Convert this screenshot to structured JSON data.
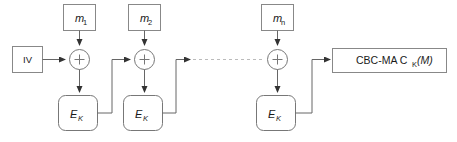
{
  "diagram": {
    "background_color": "#ffffff",
    "line_color": "#666666",
    "box_stroke_color": "#888888",
    "dashed_color": "#bbbbbb",
    "text_color": "#1a1a1a"
  },
  "iv": {
    "label": "IV"
  },
  "messages": [
    {
      "base": "m",
      "subscript": "1",
      "name": "message-block-1"
    },
    {
      "base": "m",
      "subscript": "2",
      "name": "message-block-2"
    },
    {
      "base": "m",
      "subscript": "n",
      "name": "message-block-n"
    }
  ],
  "xor": {
    "glyph": "+",
    "count": 3
  },
  "cipher": {
    "base": "E",
    "subscript": "K",
    "count": 3
  },
  "output": {
    "prefix": "CBC-MA C",
    "subscript": "K",
    "suffix": "(M)",
    "full_text": "CBC-MA C_K(M)"
  },
  "continuation": {
    "style": "dashed",
    "meaning": "ellipsis-between-stage-2-and-stage-n"
  }
}
